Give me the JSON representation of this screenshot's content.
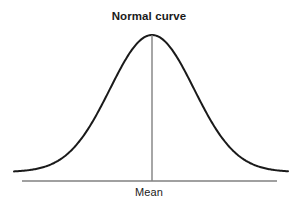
{
  "figure": {
    "title": "Normal curve",
    "background_color": "#ffffff",
    "width": 298,
    "height": 206
  },
  "labels": {
    "title": "Normal curve",
    "mean": "Mean"
  },
  "colors": {
    "curve": "#1a1a1a",
    "axis": "#808080",
    "mean_line": "#808080",
    "text": "#1a1a1a",
    "background": "#ffffff"
  },
  "chart_data": {
    "type": "line",
    "title": "Normal curve",
    "subtitle": "",
    "xlabel": "",
    "ylabel": "",
    "grid": false,
    "legend": "none",
    "annotations": [
      {
        "name": "mean-label",
        "text": "Mean",
        "x": 0,
        "position": "below-axis-center"
      },
      {
        "name": "mean-vertical-line",
        "text": "",
        "x": 0,
        "position": "center-vertical-from-peak-to-axis"
      }
    ],
    "distribution": {
      "name": "normal",
      "mean": 0,
      "sigma": 1,
      "peak_value": 1
    },
    "xlim": [
      -3.3,
      3.3
    ],
    "ylim": [
      0,
      1.08
    ],
    "x": [
      -3.3,
      -3.1,
      -2.9,
      -2.7,
      -2.5,
      -2.3,
      -2.1,
      -1.9,
      -1.7,
      -1.5,
      -1.3,
      -1.1,
      -0.9,
      -0.7,
      -0.5,
      -0.3,
      -0.1,
      0.1,
      0.3,
      0.5,
      0.7,
      0.9,
      1.1,
      1.3,
      1.5,
      1.7,
      1.9,
      2.1,
      2.3,
      2.5,
      2.7,
      2.9,
      3.1,
      3.3
    ],
    "values": [
      0.0043,
      0.0082,
      0.015,
      0.0265,
      0.0439,
      0.0707,
      0.1103,
      0.1645,
      0.2369,
      0.3247,
      0.4296,
      0.5453,
      0.667,
      0.7827,
      0.8825,
      0.956,
      0.995,
      0.995,
      0.956,
      0.8825,
      0.7827,
      0.667,
      0.5453,
      0.4296,
      0.3247,
      0.2369,
      0.1645,
      0.1103,
      0.0707,
      0.0439,
      0.0265,
      0.015,
      0.0082,
      0.0043
    ],
    "series": [
      {
        "name": "normal-curve",
        "values": [
          0.0043,
          0.0082,
          0.015,
          0.0265,
          0.0439,
          0.0707,
          0.1103,
          0.1645,
          0.2369,
          0.3247,
          0.4296,
          0.5453,
          0.667,
          0.7827,
          0.8825,
          0.956,
          0.995,
          0.995,
          0.956,
          0.8825,
          0.7827,
          0.667,
          0.5453,
          0.4296,
          0.3247,
          0.2369,
          0.1645,
          0.1103,
          0.0707,
          0.0439,
          0.0265,
          0.015,
          0.0082,
          0.0043
        ]
      }
    ]
  },
  "geometry": {
    "peak_x": 152,
    "peak_y": 35,
    "baseline_y": 172,
    "axis_y": 181,
    "axis_x_start": 22,
    "axis_x_end": 277,
    "curve_x_start": 14,
    "curve_x_end": 288,
    "sigma_px": 42,
    "curve_stroke_width": 2,
    "axis_stroke_width": 1.4
  }
}
